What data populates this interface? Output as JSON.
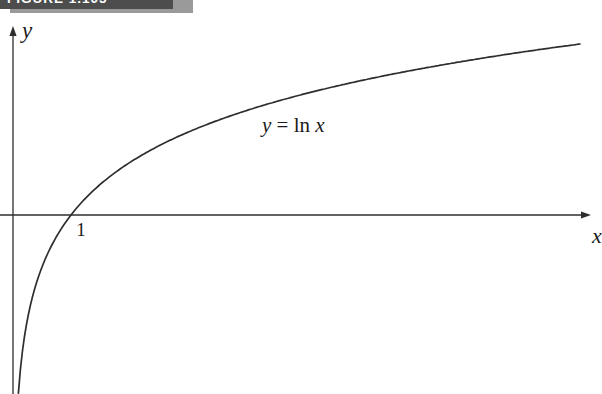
{
  "figure": {
    "label": "FIGURE 1.105"
  },
  "axes": {
    "x_label": "x",
    "y_label": "y",
    "x_tick": "1"
  },
  "equation": {
    "lhs": "y",
    "eq": "=",
    "fn": "ln",
    "arg": "x"
  },
  "colors": {
    "ink": "#2e2e2e",
    "banner_bg": "#4d4d4d",
    "banner_text": "#ffffff",
    "banner_shadow": "#9a9a9a"
  },
  "chart_data": {
    "type": "line",
    "title": "FIGURE 1.105",
    "series": [
      {
        "name": "y = ln x",
        "expression": "y = ln(x)"
      }
    ],
    "annotations": [
      "y = ln x"
    ],
    "x_tick_labels": [
      "1"
    ],
    "x_intercept": [
      1,
      0
    ],
    "vertical_asymptote": "x = 0",
    "x_domain_shown": [
      0.09,
      9.8
    ],
    "y_range_shown": [
      -2.4,
      2.3
    ],
    "axis_labels": {
      "x": "x",
      "y": "y"
    },
    "grid": false,
    "legend": false
  },
  "plot_px": {
    "y_axis_x": 13,
    "x_axis_y": 215,
    "unit_px": 58,
    "y_unit_px": 75,
    "curve_start_x": 18.4,
    "curve_end_x": 580,
    "x_axis_start": 0,
    "x_axis_tip": 591,
    "y_axis_top": 26,
    "y_axis_bottom": 394,
    "axis_stroke_width": 1.3,
    "curve_stroke_width": 1.7
  }
}
